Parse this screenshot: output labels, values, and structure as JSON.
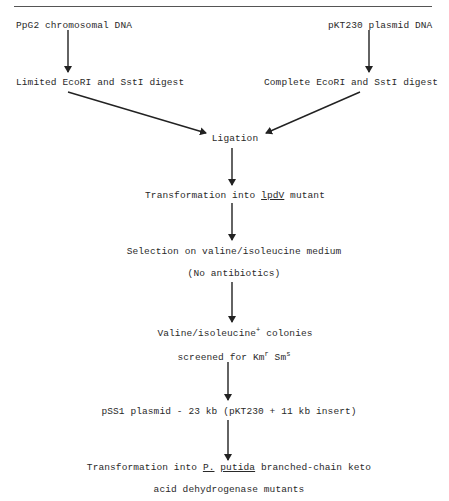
{
  "header": {
    "page_ref": "[11]"
  },
  "nodes": {
    "chromosomal": "PpG2 chromosomal DNA",
    "plasmid": "pKT230 plasmid DNA",
    "limited_digest": "Limited EcoRI and SstI digest",
    "complete_digest": "Complete EcoRI and SstI digest",
    "ligation": "Ligation",
    "transform_pre": "Transformation into ",
    "transform_gene": "lpdV",
    "transform_post": " mutant",
    "selection": "Selection on valine/isoleucine medium",
    "no_antibiotics": "(No antibiotics)",
    "colonies_pre": "Valine/isoleucine",
    "colonies_sup": "+",
    "colonies_post": " colonies",
    "screen_pre": "screened for Km",
    "screen_sup1": "r",
    "screen_mid": " Sm",
    "screen_sup2": "s",
    "pss1": "pSS1 plasmid - 23 kb (pKT230 + 11 kb insert)",
    "final_pre": "Transformation into ",
    "final_genus": "P.",
    "final_sp": "putida",
    "final_post": " branched-chain keto",
    "final_line2": "acid dehydrogenase mutants"
  },
  "edges": [
    {
      "from": "chromosomal",
      "to": "limited_digest"
    },
    {
      "from": "plasmid",
      "to": "complete_digest"
    },
    {
      "from": "limited_digest",
      "to": "ligation"
    },
    {
      "from": "complete_digest",
      "to": "ligation"
    },
    {
      "from": "ligation",
      "to": "transformation_lpdV"
    },
    {
      "from": "transformation_lpdV",
      "to": "selection"
    },
    {
      "from": "no_antibiotics",
      "to": "colonies"
    },
    {
      "from": "screened",
      "to": "pss1"
    },
    {
      "from": "pss1",
      "to": "final_transformation"
    }
  ]
}
